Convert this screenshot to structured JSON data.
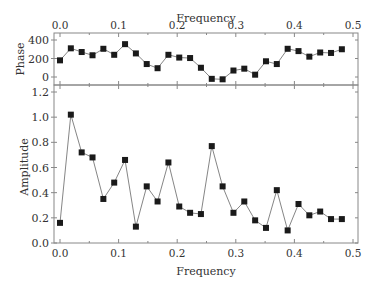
{
  "chart_data": [
    {
      "type": "line",
      "panel": "top",
      "title": "",
      "xlabel": "Frequency",
      "ylabel": "Phase",
      "xlim": [
        -0.01,
        0.5
      ],
      "ylim": [
        -60,
        400
      ],
      "xticks": [
        "0.0",
        "0.1",
        "0.2",
        "0.3",
        "0.4",
        "0.5"
      ],
      "yticks": [
        "0",
        "200",
        "400"
      ],
      "x_axis_position": "top",
      "marker": "square",
      "x": [
        0.0,
        0.0185,
        0.037,
        0.0555,
        0.074,
        0.0925,
        0.111,
        0.1295,
        0.148,
        0.1665,
        0.185,
        0.2035,
        0.222,
        0.2405,
        0.259,
        0.2775,
        0.296,
        0.3145,
        0.333,
        0.3515,
        0.37,
        0.3885,
        0.407,
        0.4255,
        0.444,
        0.4625,
        0.481
      ],
      "values": [
        180,
        310,
        270,
        235,
        305,
        240,
        355,
        255,
        140,
        95,
        240,
        210,
        205,
        100,
        -20,
        -25,
        70,
        90,
        25,
        170,
        140,
        305,
        280,
        220,
        265,
        260,
        300
      ]
    },
    {
      "type": "line",
      "panel": "bottom",
      "title": "",
      "xlabel": "Frequency",
      "ylabel": "Amplitude",
      "xlim": [
        -0.01,
        0.5
      ],
      "ylim": [
        0.0,
        1.25
      ],
      "xticks": [
        "0.0",
        "0.1",
        "0.2",
        "0.3",
        "0.4",
        "0.5"
      ],
      "yticks": [
        "0.0",
        "0.2",
        "0.4",
        "0.6",
        "0.8",
        "1.0",
        "1.2"
      ],
      "marker": "square",
      "x": [
        0.0,
        0.0185,
        0.037,
        0.0555,
        0.074,
        0.0925,
        0.111,
        0.1295,
        0.148,
        0.1665,
        0.185,
        0.2035,
        0.222,
        0.2405,
        0.259,
        0.2775,
        0.296,
        0.3145,
        0.333,
        0.3515,
        0.37,
        0.3885,
        0.407,
        0.4255,
        0.444,
        0.4625,
        0.481
      ],
      "values": [
        0.16,
        1.02,
        0.72,
        0.68,
        0.35,
        0.48,
        0.66,
        0.13,
        0.45,
        0.33,
        0.64,
        0.29,
        0.24,
        0.23,
        0.77,
        0.45,
        0.24,
        0.33,
        0.18,
        0.12,
        0.42,
        0.1,
        0.31,
        0.22,
        0.25,
        0.19,
        0.19
      ]
    }
  ],
  "labels": {
    "top_xlabel": "Frequency",
    "bottom_xlabel": "Frequency",
    "top_ylabel": "Phase",
    "bottom_ylabel": "Amplitude"
  }
}
